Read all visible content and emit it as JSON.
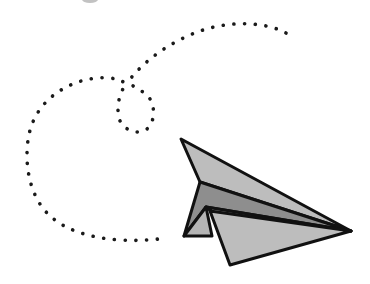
{
  "illustration": {
    "subject": "paper airplane with dotted flight trail",
    "trail_color": "#1a1a1a",
    "plane_outline_color": "#111111",
    "plane_fill_light": "#bdbdbd",
    "plane_fill_mid": "#a9a9a9",
    "plane_fill_dark": "#8e8e8e"
  }
}
